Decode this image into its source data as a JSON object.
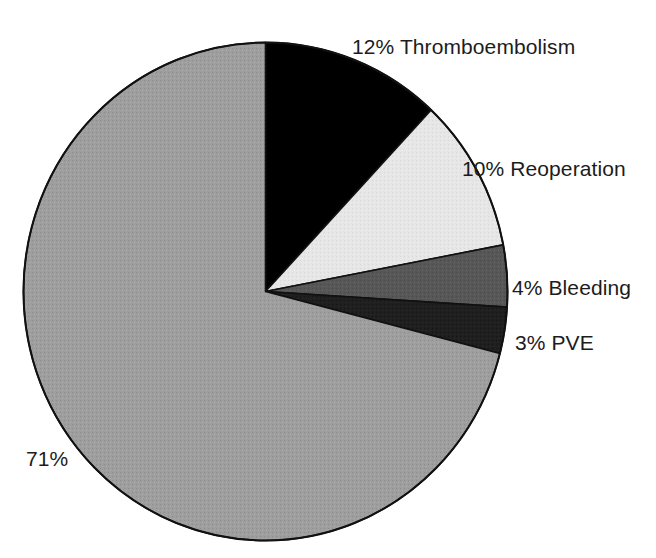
{
  "chart_data": {
    "type": "pie",
    "title": "",
    "subtitle": "",
    "xlabel": "",
    "ylabel": "",
    "legend_position": "none",
    "grid": false,
    "start_angle_deg": 0,
    "direction": "clockwise",
    "units": "percent",
    "categories": [
      "Thromboembolism",
      "Reoperation",
      "Bleeding",
      "PVE",
      ""
    ],
    "values": [
      12,
      10,
      4,
      3,
      71
    ],
    "slices": [
      {
        "name": "Thromboembolism",
        "value": 12,
        "label": "12% Thromboembolism",
        "percent_text": "12%",
        "color": "#000000",
        "start_deg": 0,
        "end_deg": 43.2
      },
      {
        "name": "Reoperation",
        "value": 10,
        "label": "10% Reoperation",
        "percent_text": "10%",
        "color": "#e6e6e6",
        "start_deg": 43.2,
        "end_deg": 79.2
      },
      {
        "name": "Bleeding",
        "value": 4,
        "label": "4% Bleeding",
        "percent_text": "4%",
        "color": "#575757",
        "start_deg": 79.2,
        "end_deg": 93.6
      },
      {
        "name": "PVE",
        "value": 3,
        "label": "3% PVE",
        "percent_text": "3%",
        "color": "#1f1f1f",
        "start_deg": 93.6,
        "end_deg": 104.4
      },
      {
        "name": "",
        "value": 71,
        "label": "71%",
        "percent_text": "71%",
        "color": "#9e9e9e",
        "start_deg": 104.4,
        "end_deg": 360
      }
    ],
    "outline_color": "#111111",
    "background_color": "#ffffff"
  },
  "labels": {
    "thromboembolism": "12% Thromboembolism",
    "reoperation": "10% Reoperation",
    "bleeding": "4% Bleeding",
    "pve": "3% PVE",
    "remainder": "71%"
  }
}
